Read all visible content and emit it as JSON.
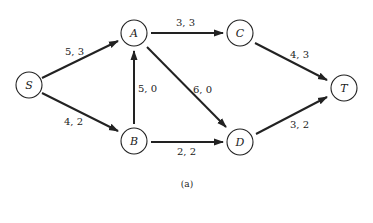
{
  "diagram": {
    "caption": "(a)",
    "nodes": {
      "S": {
        "label": "S",
        "x": 29,
        "y": 85
      },
      "A": {
        "label": "A",
        "x": 134,
        "y": 33
      },
      "B": {
        "label": "B",
        "x": 134,
        "y": 141
      },
      "C": {
        "label": "C",
        "x": 240,
        "y": 33
      },
      "D": {
        "label": "D",
        "x": 240,
        "y": 142
      },
      "T": {
        "label": "T",
        "x": 344,
        "y": 88
      }
    },
    "edges": [
      {
        "from": "S",
        "to": "A",
        "label": "5, 3"
      },
      {
        "from": "S",
        "to": "B",
        "label": "4, 2"
      },
      {
        "from": "A",
        "to": "C",
        "label": "3, 3"
      },
      {
        "from": "A",
        "to": "D",
        "label": "6, 0"
      },
      {
        "from": "B",
        "to": "A",
        "label": "5, 0"
      },
      {
        "from": "B",
        "to": "D",
        "label": "2, 2"
      },
      {
        "from": "C",
        "to": "T",
        "label": "4, 3"
      },
      {
        "from": "D",
        "to": "T",
        "label": "3, 2"
      }
    ]
  }
}
